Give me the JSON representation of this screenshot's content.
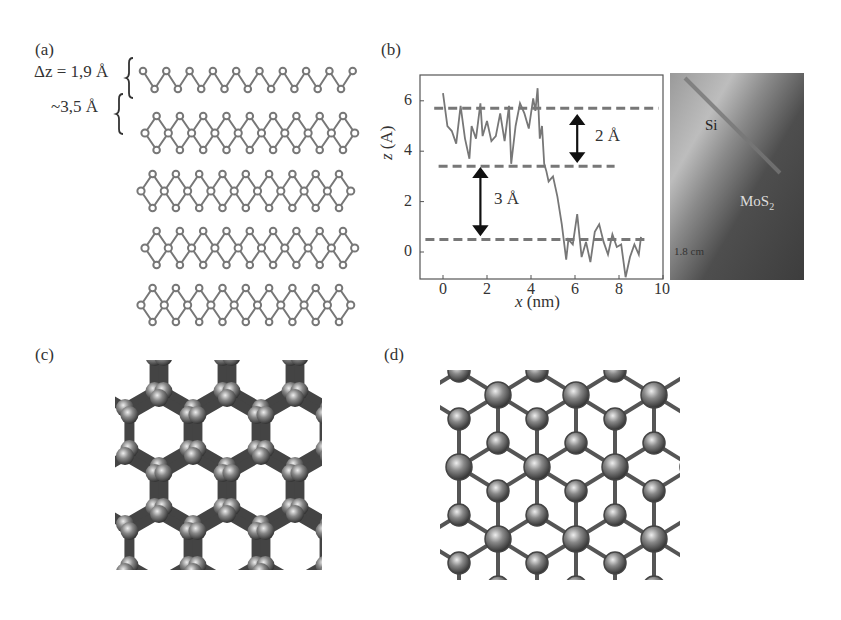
{
  "figure": {
    "panels": {
      "a": {
        "label": "(a)",
        "annotations": {
          "dz": "Δz = 1,9 Å",
          "interlayer": "~3,5 Å"
        },
        "description": "Side view of five stacked puckered layers"
      },
      "b": {
        "label": "(b)",
        "arrow_labels": {
          "upper": "2 Å",
          "lower": "3 Å"
        },
        "stm_image": {
          "labels": {
            "substrate": "Si",
            "material": "MoS2",
            "material_base": "MoS",
            "material_sub": "2",
            "scale": "1.8 cm"
          }
        }
      },
      "c": {
        "label": "(c)",
        "description": "Top view honeycomb lattice (buckled)"
      },
      "d": {
        "label": "(d)",
        "description": "Top view trigonal lattice"
      }
    }
  },
  "chart_data": {
    "type": "line",
    "title": "",
    "xlabel": "x (nm)",
    "ylabel": "z (A)",
    "xlim": [
      -1,
      10
    ],
    "ylim": [
      -1,
      7
    ],
    "xticks": [
      0,
      2,
      4,
      6,
      8,
      10
    ],
    "yticks": [
      0,
      2,
      4,
      6
    ],
    "grid": false,
    "series": [
      {
        "name": "height profile",
        "x": [
          0.0,
          0.2,
          0.4,
          0.6,
          0.8,
          1.0,
          1.2,
          1.3,
          1.5,
          1.7,
          1.8,
          2.0,
          2.2,
          2.4,
          2.6,
          2.8,
          3.0,
          3.1,
          3.3,
          3.5,
          3.7,
          3.9,
          4.1,
          4.2,
          4.3,
          4.4,
          4.5,
          4.6,
          4.7,
          4.8,
          5.0,
          5.2,
          5.4,
          5.6,
          5.7,
          5.9,
          6.1,
          6.3,
          6.5,
          6.7,
          6.9,
          7.1,
          7.3,
          7.5,
          7.7,
          7.9,
          8.1,
          8.3,
          8.5,
          8.7,
          8.9,
          9.0
        ],
        "y": [
          6.3,
          5.0,
          4.8,
          4.3,
          5.8,
          4.5,
          3.7,
          5.0,
          4.5,
          5.9,
          4.6,
          5.2,
          4.4,
          4.6,
          5.5,
          4.4,
          5.8,
          3.5,
          5.0,
          5.9,
          5.5,
          4.9,
          6.1,
          5.6,
          6.5,
          4.5,
          5.0,
          3.5,
          3.2,
          2.8,
          3.0,
          2.2,
          1.1,
          -0.3,
          0.5,
          0.3,
          1.5,
          -0.2,
          0.4,
          -0.4,
          0.8,
          1.1,
          0.4,
          -0.1,
          0.7,
          0.2,
          0.3,
          -1.0,
          -0.2,
          0.3,
          -0.1,
          0.6
        ]
      }
    ],
    "reference_lines": [
      {
        "type": "hline",
        "y": 5.7,
        "x_range": [
          -0.4,
          9.8
        ],
        "style": "dashed"
      },
      {
        "type": "hline",
        "y": 3.4,
        "x_range": [
          -0.2,
          7.8
        ],
        "style": "dashed"
      },
      {
        "type": "hline",
        "y": 0.5,
        "x_range": [
          -0.8,
          9.3
        ],
        "style": "dashed"
      }
    ],
    "annotations": [
      {
        "text": "2 Å",
        "type": "double-arrow",
        "x": 6.1,
        "y_range": [
          3.6,
          5.4
        ]
      },
      {
        "text": "3 Å",
        "type": "double-arrow",
        "x": 1.7,
        "y_range": [
          0.7,
          3.3
        ]
      }
    ]
  }
}
